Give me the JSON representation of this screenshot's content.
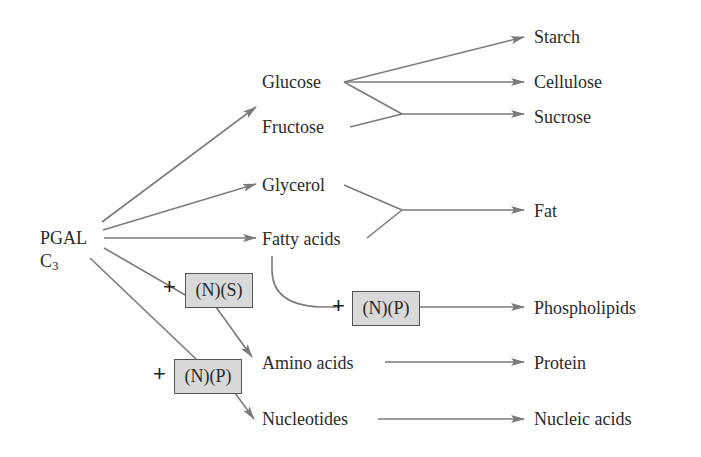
{
  "diagram": {
    "source": {
      "name": "PGAL",
      "formula_base": "C",
      "formula_sub": "3"
    },
    "intermediates": {
      "glucose": "Glucose",
      "fructose": "Fructose",
      "glycerol": "Glycerol",
      "fatty_acids": "Fatty acids",
      "amino_acids": "Amino acids",
      "nucleotides": "Nucleotides"
    },
    "products": {
      "starch": "Starch",
      "cellulose": "Cellulose",
      "sucrose": "Sucrose",
      "fat": "Fat",
      "phospholipids": "Phospholipids",
      "protein": "Protein",
      "nucleic_acids": "Nucleic acids"
    },
    "additions": {
      "plus": "+",
      "ns": "(N)(S)",
      "np_phospholipid": "(N)(P)",
      "np_nucleotide": "(N)(P)"
    },
    "colors": {
      "line": "#7a7a7a",
      "box_fill": "#d9d9d9",
      "box_border": "#555555",
      "text": "#2a2a2a"
    }
  }
}
